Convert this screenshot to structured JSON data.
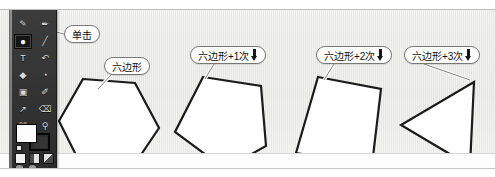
{
  "page": {
    "top_caption": "",
    "width": 495,
    "height": 177
  },
  "colors": {
    "canvas_bg": "#e6e6e4",
    "toolbar_bg": "#333333",
    "shape_stroke": "#1b1b1b",
    "shape_fill": "#ffffff",
    "balloon_border": "#777777",
    "balloon_bg": "#ffffff",
    "text": "#111111"
  },
  "toolbar": {
    "name": "photoshop-tool-palette",
    "foreground_color": "#ffffff",
    "background_color": "#2e2e2e",
    "tools": [
      {
        "name": "lasso-tool",
        "glyph": "✎"
      },
      {
        "name": "magic-wand-tool",
        "glyph": "✒"
      },
      {
        "name": "ellipse-marquee-tool",
        "glyph": "●",
        "selected": true
      },
      {
        "name": "line-tool",
        "glyph": "╱"
      },
      {
        "name": "type-tool",
        "glyph": "T"
      },
      {
        "name": "history-brush-tool",
        "glyph": "↶"
      },
      {
        "name": "gradient-tool",
        "glyph": "◆"
      },
      {
        "name": "dodge-tool",
        "glyph": "◔"
      },
      {
        "name": "rectangle-tool",
        "glyph": "▣"
      },
      {
        "name": "eyedropper-tool",
        "glyph": "✐"
      },
      {
        "name": "pen-tool",
        "glyph": "↗"
      },
      {
        "name": "eraser-tool",
        "glyph": "⌫"
      },
      {
        "name": "crop-tool",
        "glyph": "⌘"
      },
      {
        "name": "zoom-tool",
        "glyph": "⚲"
      }
    ],
    "mode_buttons": [
      {
        "name": "standard-mode-button"
      },
      {
        "name": "quick-mask-mode-button"
      },
      {
        "name": "screen-mode-button"
      }
    ]
  },
  "callouts": [
    {
      "name": "callout-click",
      "text": "单击",
      "has_arrow_icon": false,
      "x": 64,
      "y": 15,
      "target": "ellipse-marquee-tool"
    },
    {
      "name": "callout-hexagon",
      "text": "六边形",
      "has_arrow_icon": false,
      "x": 104,
      "y": 47,
      "target": "shape-hexagon"
    },
    {
      "name": "callout-hexagon-plus-1",
      "text": "六边形+1次",
      "has_arrow_icon": true,
      "x": 190,
      "y": 36,
      "target": "shape-pentagon"
    },
    {
      "name": "callout-hexagon-plus-2",
      "text": "六边形+2次",
      "has_arrow_icon": true,
      "x": 316,
      "y": 36,
      "target": "shape-square"
    },
    {
      "name": "callout-hexagon-plus-3",
      "text": "六边形+3次",
      "has_arrow_icon": true,
      "x": 404,
      "y": 36,
      "target": "shape-triangle"
    }
  ],
  "shapes": [
    {
      "name": "shape-hexagon",
      "sides": 6,
      "label": "六边形",
      "x": 56,
      "y": 63,
      "w": 105,
      "h": 98
    },
    {
      "name": "shape-pentagon",
      "sides": 5,
      "label": "六边形+1次",
      "x": 172,
      "y": 63,
      "w": 105,
      "h": 98
    },
    {
      "name": "shape-square",
      "sides": 4,
      "label": "六边形+2次",
      "x": 292,
      "y": 63,
      "w": 105,
      "h": 98
    },
    {
      "name": "shape-triangle",
      "sides": 3,
      "label": "六边形+3次",
      "x": 398,
      "y": 63,
      "w": 95,
      "h": 98
    }
  ]
}
